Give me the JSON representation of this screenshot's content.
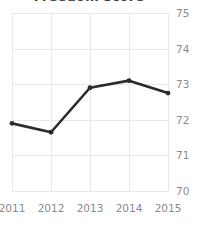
{
  "chart_data": {
    "type": "line",
    "title": "Freedom score",
    "xlabel": "",
    "ylabel": "",
    "categories": [
      "2011",
      "2012",
      "2013",
      "2014",
      "2015"
    ],
    "values": [
      71.9,
      71.65,
      72.9,
      73.1,
      72.75
    ],
    "series": [
      {
        "name": "Freedom score",
        "values": [
          71.9,
          71.65,
          72.9,
          73.1,
          72.75
        ]
      }
    ],
    "ylim": [
      70,
      75
    ],
    "yticks": [
      "70",
      "71",
      "72",
      "73",
      "74",
      "75"
    ],
    "xticks": [
      "2011",
      "2012",
      "2013",
      "2014",
      "2015"
    ],
    "grid": true,
    "legend": "none",
    "y_axis_position": "right",
    "marker": "circle",
    "colors": {
      "line": "#2b2b2b",
      "marker": "#2b2b2b",
      "grid": "#e8e8e8",
      "tick_label": "#8a8a8a",
      "title": "#3c3c3c",
      "background": "#ffffff"
    }
  }
}
